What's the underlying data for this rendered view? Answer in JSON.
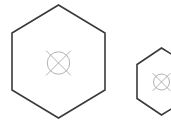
{
  "canvas": {
    "width": 171,
    "height": 125,
    "background": "#ffffff"
  },
  "palette": {
    "hexagon_stroke": "#3a3a3a",
    "marker_stroke": "#a8a8a8",
    "background": "#ffffff"
  },
  "scene": {
    "title": "Two hexagon outlines with crossed-circle center markers",
    "shape_count": 2,
    "shapes": [
      {
        "id": "hexagon-large",
        "label": "Large hexagon",
        "kind": "hexagon",
        "orientation": "flat-left-right",
        "center_x": 58.5,
        "center_y": 61.5,
        "radius": 57,
        "half_width": 46.5,
        "stroke_width": 1.6,
        "stroke_color": "#3a3a3a",
        "fill": "none",
        "clipped": false,
        "points": "58.5,5 105,33 105,90 58.5,118 12,90 12,33",
        "marker": {
          "id": "marker-large",
          "label": "Crossed circle marker",
          "center_x": 58.5,
          "center_y": 63,
          "circle_radius": 11.2,
          "cross_reach": 17.5,
          "stroke_width": 0.9,
          "stroke_color": "#a8a8a8"
        }
      },
      {
        "id": "hexagon-small",
        "label": "Small hexagon",
        "kind": "hexagon",
        "orientation": "flat-left-right",
        "center_x": 161.5,
        "center_y": 81.5,
        "radius": 33,
        "half_width": 25,
        "stroke_width": 1.6,
        "stroke_color": "#3a3a3a",
        "fill": "none",
        "clipped": true,
        "clipped_edge": "right",
        "points": "161.5,48 188,64.5 188,98.5 161.5,115 137,98.5 137,64.5",
        "marker": {
          "id": "marker-small",
          "label": "Crossed circle marker",
          "center_x": 161.5,
          "center_y": 82,
          "circle_radius": 8.0,
          "cross_reach": 12.5,
          "stroke_width": 0.9,
          "stroke_color": "#a8a8a8"
        }
      }
    ]
  }
}
